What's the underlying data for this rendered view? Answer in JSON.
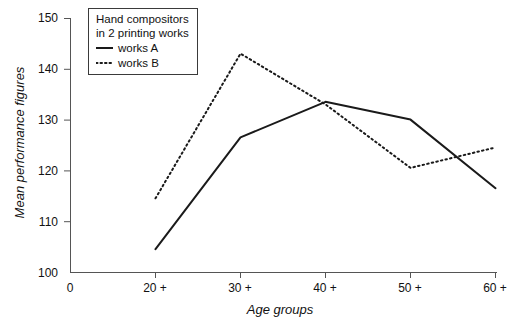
{
  "chart_data": {
    "type": "line",
    "title": "",
    "xlabel": "Age groups",
    "ylabel": "Mean performance figures",
    "categories": [
      "20 +",
      "30 +",
      "40 +",
      "50 +",
      "60 +"
    ],
    "x_origin_label": "0",
    "xlim": [
      0,
      5
    ],
    "ylim": [
      100,
      150
    ],
    "y_ticks": [
      100,
      110,
      120,
      130,
      140,
      150
    ],
    "x_ticks": [
      "0",
      "20 +",
      "30 +",
      "40 +",
      "50 +",
      "60 +"
    ],
    "grid": false,
    "legend_position": "top-left-inside",
    "series": [
      {
        "name": "works A",
        "style": "solid",
        "color": "#1a1a1a",
        "values": [
          104.5,
          126.5,
          133.5,
          130.0,
          116.5
        ]
      },
      {
        "name": "works B",
        "style": "dotted",
        "color": "#1a1a1a",
        "values": [
          114.5,
          143.0,
          133.0,
          120.5,
          124.5
        ]
      }
    ]
  },
  "legend": {
    "title_line_1": "Hand compositors",
    "title_line_2": "in 2 printing works",
    "entries": [
      {
        "label": "works A",
        "style": "solid"
      },
      {
        "label": "works B",
        "style": "dotted"
      }
    ]
  },
  "axis": {
    "y_title": "Mean performance figures",
    "x_title": "Age groups"
  }
}
